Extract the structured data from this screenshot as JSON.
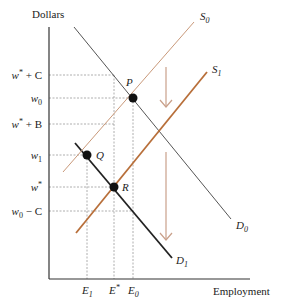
{
  "axes": {
    "y_label": "Dollars",
    "x_label": "Employment"
  },
  "colors": {
    "axis": "#333333",
    "demand": "#555555",
    "demand_shifted": "#222222",
    "supply": "#c9997a",
    "supply_shifted": "#b86f3a",
    "guides": "#999999",
    "arrow": "#c9a08a",
    "point": "#111111"
  },
  "y_ticks": [
    {
      "id": "w_star_plus_C",
      "base": "w",
      "sup": "*",
      "suffix": " + C"
    },
    {
      "id": "w0",
      "base": "w",
      "sub": "0",
      "suffix": ""
    },
    {
      "id": "w_star_plus_B",
      "base": "w",
      "sup": "*",
      "suffix": " + B"
    },
    {
      "id": "w1",
      "base": "w",
      "sub": "1",
      "suffix": ""
    },
    {
      "id": "w_star",
      "base": "w",
      "sup": "*",
      "suffix": ""
    },
    {
      "id": "w0_minus_C",
      "base": "w",
      "sub": "0",
      "suffix": " − C"
    }
  ],
  "x_ticks": [
    {
      "id": "E1",
      "base": "E",
      "sub": "1"
    },
    {
      "id": "E_star",
      "base": "E",
      "sup": "*"
    },
    {
      "id": "E0",
      "base": "E",
      "sub": "0"
    }
  ],
  "curves": {
    "S0": {
      "base": "S",
      "sub": "0"
    },
    "S1": {
      "base": "S",
      "sub": "1"
    },
    "D0": {
      "base": "D",
      "sub": "0"
    },
    "D1": {
      "base": "D",
      "sub": "1"
    }
  },
  "points": {
    "P": "P",
    "Q": "Q",
    "R": "R"
  }
}
